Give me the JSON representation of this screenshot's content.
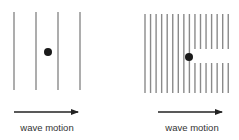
{
  "diagram": {
    "panels": [
      {
        "id": "sparse-waves",
        "wavefronts": {
          "count": 4,
          "x": [
            14,
            36,
            58,
            80
          ],
          "y_top": 12,
          "y_bottom": 90,
          "color": "#8a8a8a"
        },
        "particle": {
          "x": 48,
          "y": 52,
          "r": 4,
          "color": "#1a1a1a"
        },
        "arrow": {
          "x1": 14,
          "x2": 80,
          "y": 112
        },
        "label": "wave motion",
        "label_x": 47,
        "label_y": 122
      },
      {
        "id": "dense-waves-with-gap",
        "wavefronts": {
          "count": 16,
          "x_start": 145,
          "spacing": 5.55,
          "y_top": 14,
          "y_bottom": 93,
          "color": "#8a8a8a",
          "gap": {
            "after_x": 190,
            "y_top": 49,
            "y_bottom": 63
          }
        },
        "particle": {
          "x": 189,
          "y": 57,
          "r": 4,
          "color": "#1a1a1a"
        },
        "arrow": {
          "x1": 158,
          "x2": 224,
          "y": 112
        },
        "label": "wave motion",
        "label_x": 192,
        "label_y": 122
      }
    ],
    "arrow_color": "#222222"
  }
}
